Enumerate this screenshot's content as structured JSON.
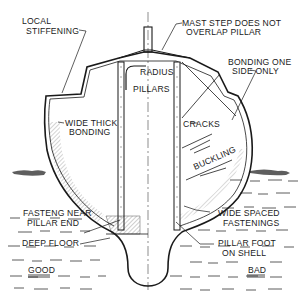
{
  "diagram": {
    "colors": {
      "ink": "#1a1a1a",
      "background": "#ffffff"
    },
    "labels": {
      "local_stiffening": [
        "LOCAL",
        "STIFFENING"
      ],
      "mast_step": [
        "MAST STEP DOES NOT",
        "OVERLAP PILLAR"
      ],
      "radius": "RADIUS",
      "pillars": "PILLARS",
      "bonding_one_side": [
        "BONDING ONE",
        "SIDE  ONLY"
      ],
      "wide_thick_bonding": [
        "WIDE THICK",
        "BONDING"
      ],
      "cracks": "CRACKS",
      "buckling": "BUCKLING",
      "fasteng_near_pillar_end": [
        "FASTENG NEAR",
        "PILLAR  END"
      ],
      "deep_floor": "DEEP FLOOR",
      "wide_spaced_fastenings": [
        "WIDE SPACED",
        "FASTENINGS"
      ],
      "pillar_foot_on_shell": [
        "PILLAR FOOT",
        "ON SHELL"
      ],
      "good": "GOOD",
      "bad": "BAD"
    }
  }
}
